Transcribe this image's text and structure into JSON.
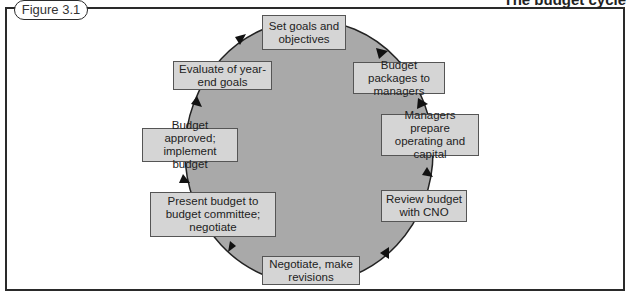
{
  "figure": {
    "label": "Figure 3.1",
    "title": "The budget cycle"
  },
  "cycle": {
    "circle_fill": "#a9a9a9",
    "box_fill": "#d5d5d5",
    "steps": [
      {
        "id": "set-goals",
        "text": "Set goals and objectives"
      },
      {
        "id": "budget-packages",
        "text": "Budget packages to managers"
      },
      {
        "id": "managers-prepare",
        "text": "Managers prepare operating and capital"
      },
      {
        "id": "review-budget",
        "text": "Review budget with CNO"
      },
      {
        "id": "negotiate-revisions",
        "text": "Negotiate, make revisions"
      },
      {
        "id": "present-budget",
        "text": "Present budget to budget committee; negotiate"
      },
      {
        "id": "budget-approved",
        "text": "Budget approved; implement budget"
      },
      {
        "id": "evaluate-goals",
        "text": "Evaluate of year-end goals"
      }
    ]
  }
}
